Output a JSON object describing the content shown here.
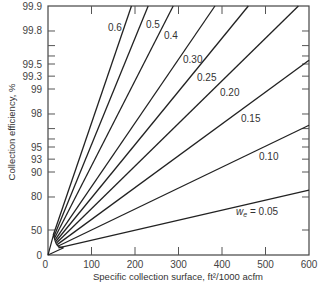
{
  "chart_data": {
    "type": "line",
    "title": "",
    "xlabel": "Specific collection surface, ft²/1000 acfm",
    "ylabel": "Collection efficiency, %",
    "xlim": [
      0,
      600
    ],
    "ylim": [
      0,
      99.9
    ],
    "y_scale": "log-penetration (-ln(1-η))",
    "grid": false,
    "legend_position": "inline-labels",
    "x_ticks": [
      0,
      100,
      200,
      300,
      400,
      500,
      600
    ],
    "x_tick_labels": [
      "0",
      "100",
      "200",
      "300",
      "400",
      "500",
      "600"
    ],
    "y_ticks": [
      0,
      50,
      80,
      90,
      93,
      95,
      96,
      97,
      98,
      99,
      99.3,
      99.5,
      99.6,
      99.7,
      99.8,
      99.9
    ],
    "y_tick_labels": {
      "0": "0",
      "50": "50",
      "80": "80",
      "90": "90",
      "93": "93",
      "95": "95",
      "98": "98",
      "99": "99",
      "99.3": "99.3",
      "99.5": "99.5",
      "99.8": "99.8",
      "99.9": "99.9"
    },
    "series": [
      {
        "name": "0.6",
        "label": "0.6",
        "w": 0.6,
        "x": [
          0,
          192
        ],
        "y": [
          0,
          99.9
        ]
      },
      {
        "name": "0.5",
        "label": "0.5",
        "w": 0.5,
        "x": [
          0,
          230
        ],
        "y": [
          0,
          99.9
        ]
      },
      {
        "name": "0.4",
        "label": "0.4",
        "w": 0.4,
        "x": [
          0,
          288
        ],
        "y": [
          0,
          99.9
        ]
      },
      {
        "name": "0.30",
        "label": "0.30",
        "w": 0.3,
        "x": [
          0,
          384
        ],
        "y": [
          0,
          99.9
        ]
      },
      {
        "name": "0.25",
        "label": "0.25",
        "w": 0.25,
        "x": [
          0,
          460
        ],
        "y": [
          0,
          99.9
        ]
      },
      {
        "name": "0.20",
        "label": "0.20",
        "w": 0.2,
        "x": [
          0,
          576
        ],
        "y": [
          0,
          99.9
        ]
      },
      {
        "name": "0.15",
        "label": "0.15",
        "w": 0.15,
        "x": [
          0,
          600
        ],
        "y": [
          0,
          99.55
        ]
      },
      {
        "name": "0.10",
        "label": "0.10",
        "w": 0.1,
        "x": [
          0,
          600
        ],
        "y": [
          0,
          97.3
        ]
      },
      {
        "name": "0.05",
        "label": "w_e = 0.05",
        "w": 0.05,
        "x": [
          0,
          600
        ],
        "y": [
          0,
          83.5
        ]
      }
    ],
    "label_positions": [
      {
        "text": "0.6",
        "x": 108,
        "y": 31
      },
      {
        "text": "0.5",
        "x": 146,
        "y": 28
      },
      {
        "text": "0.4",
        "x": 164,
        "y": 39
      },
      {
        "text": "0.30",
        "x": 183,
        "y": 63
      },
      {
        "text": "0.25",
        "x": 197,
        "y": 81
      },
      {
        "text": "0.20",
        "x": 220,
        "y": 96
      },
      {
        "text": "0.15",
        "x": 241,
        "y": 122
      },
      {
        "text": "0.10",
        "x": 259,
        "y": 160
      },
      {
        "text": "= 0.05",
        "x": 254,
        "y": 215
      }
    ],
    "w_symbol": "w",
    "w_subscript": "e"
  }
}
